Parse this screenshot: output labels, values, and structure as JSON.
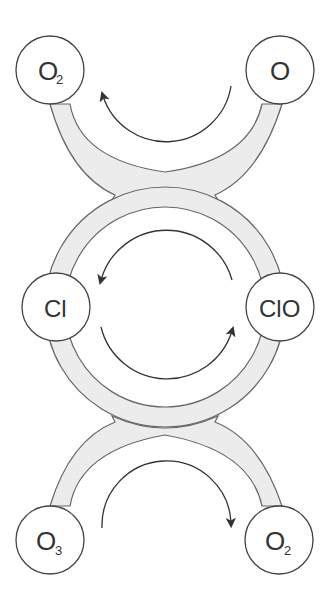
{
  "diagram": {
    "title": "",
    "nodes": [
      {
        "id": "top_left",
        "main": "O",
        "sub": "2"
      },
      {
        "id": "top_right",
        "main": "O",
        "sub": ""
      },
      {
        "id": "mid_left",
        "main": "Cl",
        "sub": ""
      },
      {
        "id": "mid_right",
        "main": "ClO",
        "sub": ""
      },
      {
        "id": "bottom_left",
        "main": "O",
        "sub": "3"
      },
      {
        "id": "bottom_right",
        "main": "O",
        "sub": "2"
      }
    ],
    "arrows": [
      {
        "from": "O",
        "to": "O2",
        "direction": "right-to-left (top arc)"
      },
      {
        "from": "ClO",
        "to": "Cl",
        "direction": "counter-clockwise (upper half)"
      },
      {
        "from": "Cl",
        "to": "ClO",
        "direction": "counter-clockwise (lower half)"
      },
      {
        "from": "O3",
        "to": "O2",
        "direction": "left-to-right (bottom arc)"
      }
    ],
    "colors": {
      "band_fill": "#ececec",
      "stroke": "#555555",
      "arrow": "#333333"
    }
  }
}
